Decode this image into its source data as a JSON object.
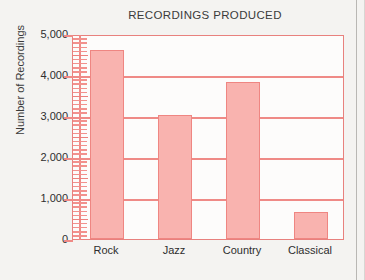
{
  "chart_data": {
    "type": "bar",
    "title": "RECORDINGS PRODUCED",
    "xlabel": "",
    "ylabel": "Number of Recordings",
    "categories": [
      "Rock",
      "Jazz",
      "Country",
      "Classical"
    ],
    "values": [
      4620,
      3020,
      3840,
      650
    ],
    "ylim": [
      0,
      5000
    ],
    "ytick_labels": [
      "0",
      "1,000",
      "2,000",
      "3,000",
      "4,000",
      "5,000"
    ],
    "ytick_values": [
      0,
      1000,
      2000,
      3000,
      4000,
      5000
    ],
    "y_major_step": 1000,
    "y_minor_step": 100,
    "grid": "horizontal",
    "legend": "none",
    "colors": {
      "bar_fill": "#f9b3af",
      "bar_border": "#ef8682",
      "gridline": "#ef8a86",
      "axis": "#e8817e",
      "text": "#2e2e2e",
      "title_text": "#3b3b3b",
      "background": "#f4f3f1",
      "plot_background": "#fdfcfb"
    }
  }
}
